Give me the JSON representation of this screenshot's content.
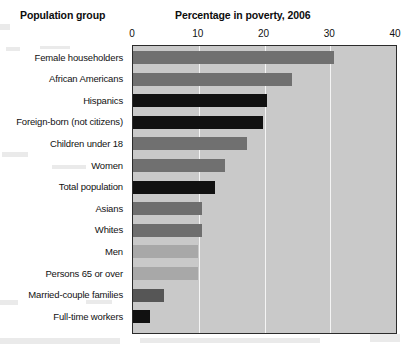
{
  "header": {
    "group_label": "Population group",
    "chart_title": "Percentage in poverty, 2006"
  },
  "axis": {
    "ticks": [
      "0",
      "10",
      "20",
      "30",
      "40"
    ],
    "min": 0,
    "max": 40
  },
  "colors": {
    "plot_background": "#c9c9c9",
    "gridline": "#f4f4f4",
    "frame": "#2b2b2b",
    "bar_medium_gray": "#707070",
    "bar_black": "#111111",
    "bar_dark_gray": "#565656",
    "bar_light_gray": "#a8a8a8",
    "bar_mid_light_gray": "#9a9a9a"
  },
  "chart_data": {
    "type": "bar",
    "orientation": "horizontal",
    "title": "Percentage in poverty, 2006",
    "xlabel": "Percentage in poverty, 2006",
    "ylabel": "Population group",
    "xlim": [
      0,
      40
    ],
    "ylim": null,
    "grid": true,
    "gridlines_at": [
      10,
      20,
      30
    ],
    "legend": false,
    "legend_position": "none",
    "categories": [
      "Female householders",
      "African Americans",
      "Hispanics",
      "Foreign-born (not citizens)",
      "Children under 18",
      "Women",
      "Total population",
      "Asians",
      "Whites",
      "Men",
      "Persons 65 or over",
      "Married-couple families",
      "Full-time workers"
    ],
    "values": [
      30.5,
      24.2,
      20.4,
      19.8,
      17.3,
      14.0,
      12.5,
      10.5,
      10.5,
      9.9,
      9.9,
      4.7,
      2.6
    ],
    "bar_colors": [
      "#707070",
      "#707070",
      "#111111",
      "#111111",
      "#707070",
      "#707070",
      "#111111",
      "#6e6e6e",
      "#6e6e6e",
      "#a8a8a8",
      "#a8a8a8",
      "#565656",
      "#111111"
    ]
  }
}
